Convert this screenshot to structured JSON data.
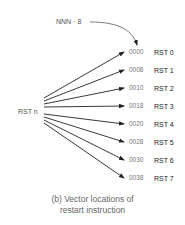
{
  "diagram": {
    "source_label": "RST n",
    "offset_label": "NNN · 8",
    "vectors": [
      {
        "address": "0000",
        "name": "RST 0"
      },
      {
        "address": "0008",
        "name": "RST 1"
      },
      {
        "address": "0010",
        "name": "RST 2"
      },
      {
        "address": "0018",
        "name": "RST 3"
      },
      {
        "address": "0020",
        "name": "RST 4"
      },
      {
        "address": "0028",
        "name": "RST 5"
      },
      {
        "address": "0030",
        "name": "RST 6"
      },
      {
        "address": "0038",
        "name": "RST 7"
      }
    ],
    "caption_line1": "(b) Vector locations of",
    "caption_line2": "restart instruction"
  }
}
